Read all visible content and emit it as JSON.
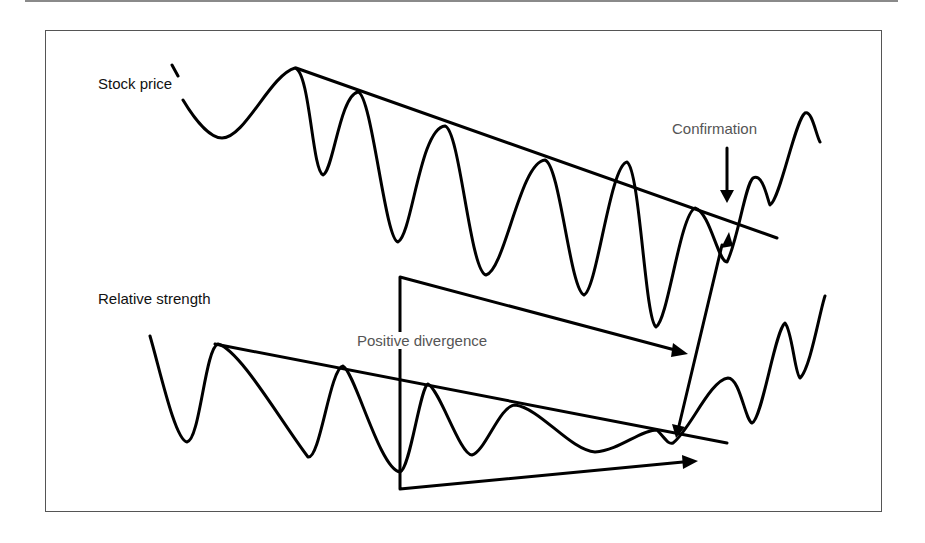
{
  "labels": {
    "stock_price": "Stock price",
    "relative_strength": "Relative strength",
    "confirmation": "Confirmation",
    "positive_divergence": "Positive divergence"
  },
  "colors": {
    "stroke": "#000000",
    "frame": "#555555",
    "label_dark": "#111111",
    "label_gray": "#555555"
  },
  "paths": {
    "stock_price_curve": "M 172 65 L 178 76 M 183 100 C 195 120, 210 138, 222 138 C 245 138, 270 75, 295 68 C 310 72, 312 170, 323 175 C 333 172, 340 95, 358 92 C 372 95, 385 240, 398 242 C 412 235, 420 128, 445 126 C 460 130, 470 272, 486 275 C 505 270, 520 162, 545 160 C 560 165, 570 290, 584 295 C 597 290, 610 165, 627 162 C 640 170, 645 320, 656 327 C 668 320, 680 215, 695 208 C 710 212, 718 262, 727 262 C 738 240, 745 185, 753 178 C 763 172, 768 202, 770 205 C 780 200, 795 120, 805 113 C 812 110, 816 135, 820 142",
    "stock_trendline": "M 296 68 L 777 238",
    "rs_curve": "M 150 336 C 160 370, 175 440, 187 442 C 200 440, 205 348, 218 344 C 240 350, 280 420, 308 457 C 320 460, 330 368, 343 366 C 355 372, 380 470, 400 472 C 410 470, 420 387, 428 384 C 440 390, 460 455, 472 455 C 485 452, 500 405, 515 405 C 540 408, 570 450, 595 452 C 620 450, 640 430, 657 430 C 665 438, 668 445, 673 443 C 690 430, 710 380, 728 378 C 740 378, 745 420, 752 423 C 762 420, 775 330, 785 323 C 792 330, 795 375, 800 378 C 810 370, 820 310, 825 296",
    "rs_trendline": "M 215 344 L 727 443",
    "divergence_top_arrow": "M 400 470 L 400 277 L 675 350",
    "divergence_bottom_arrow": "M 400 470 L 400 489 L 683 462",
    "confirmation_diag_arrow_line": "M 722 245 L 678 430",
    "confirmation_down_arrow_line": "M 727 148 L 727 192"
  },
  "arrowheads": {
    "confirmation_down": "720,190 734,190 727,203",
    "confirmation_up": "721,248 733,246 729,232",
    "divergence_top": "673,343 688,354 671,357",
    "divergence_bottom": "682,455 698,461 683,469",
    "confirmation_lower": "672,424 685,427 676,438"
  }
}
